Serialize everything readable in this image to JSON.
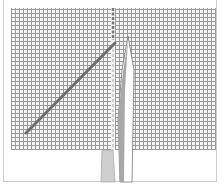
{
  "illustration": {
    "subject": "needle inserted through woven fabric with diagonal stitch thread",
    "colors": {
      "fabric_grid": "#9a9a9a",
      "fabric_bg": "#f4f4f4",
      "thread": "#6e6e6e",
      "needle_fill": "#ffffff",
      "needle_shadow": "#9c9c9c",
      "frame": "#cccccc"
    },
    "elements": [
      "fabric-weave",
      "diagonal-thread",
      "vertical-stitch-line",
      "needle",
      "needle-shadow"
    ]
  }
}
